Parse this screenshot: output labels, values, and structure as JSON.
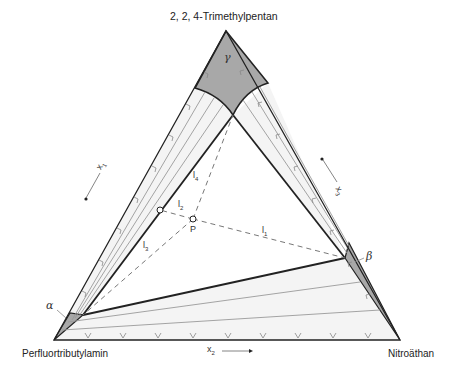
{
  "diagram": {
    "type": "ternary-phase-diagram",
    "vertices": {
      "top": "2, 2, 4-Trimethylpentan",
      "bottom_left": "Perfluortributylamin",
      "bottom_right": "Nitroäthan"
    },
    "axes": {
      "left": "x1",
      "right": "x3",
      "bottom": "x2"
    },
    "axis_labels": {
      "x1_main": "x",
      "x1_sub": "1",
      "x2_main": "x",
      "x2_sub": "2",
      "x3_main": "x",
      "x3_sub": "3"
    },
    "phases": {
      "alpha": "α",
      "beta": "β",
      "gamma": "γ"
    },
    "point": "P",
    "lines": {
      "l1_main": "l",
      "l1_sub": "1",
      "l2_main": "l",
      "l2_sub": "2",
      "l3_main": "l",
      "l3_sub": "3",
      "l4_main": "l",
      "l4_sub": "4"
    },
    "colors": {
      "phase_fill": "#a8a8a8",
      "two_phase_fill": "#f3f3f3",
      "outline": "#222222",
      "tie_line": "#9a9a9a",
      "dashed": "#777777"
    }
  }
}
